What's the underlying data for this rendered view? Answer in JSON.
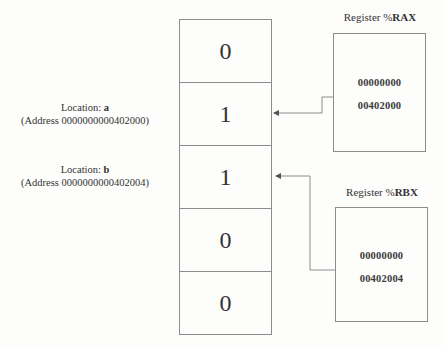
{
  "memory": {
    "cells": [
      {
        "value": "0"
      },
      {
        "value": "1"
      },
      {
        "value": "1"
      },
      {
        "value": "0"
      },
      {
        "value": "0"
      }
    ]
  },
  "locations": [
    {
      "prefix": "Location: ",
      "name": "a",
      "address_line": "(Address 0000000000402000)"
    },
    {
      "prefix": "Location: ",
      "name": "b",
      "address_line": "(Address 0000000000402004)"
    }
  ],
  "registers": [
    {
      "title_prefix": "Register %",
      "name": "RAX",
      "high": "00000000",
      "low": "00402000",
      "points_to": "a"
    },
    {
      "title_prefix": "Register %",
      "name": "RBX",
      "high": "00000000",
      "low": "00402004",
      "points_to": "b"
    }
  ],
  "colors": {
    "line": "#8c8c8c",
    "text": "#333333",
    "background": "#fdfdfc"
  }
}
